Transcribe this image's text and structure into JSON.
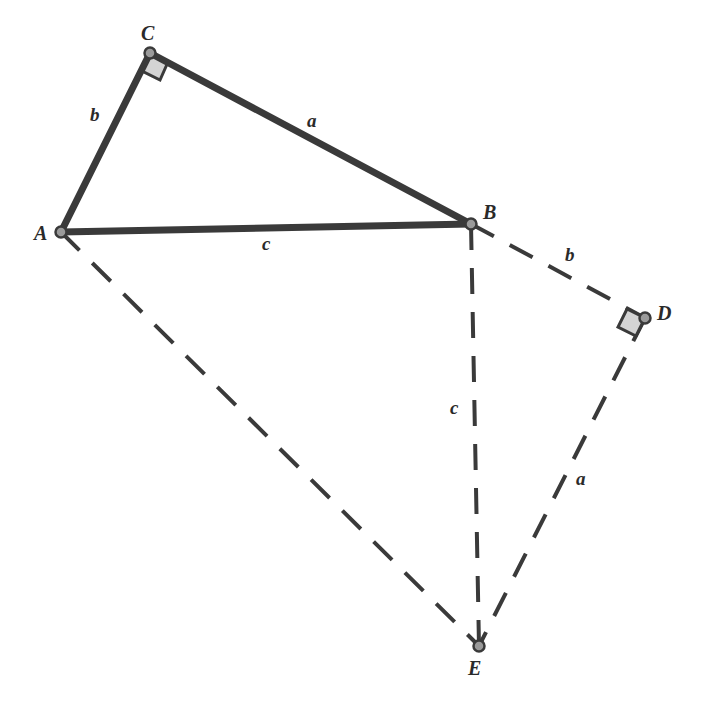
{
  "diagram": {
    "colors": {
      "solid_stroke": "#3a3a3a",
      "dashed_stroke": "#3a3a3a",
      "point_fill": "#9a9a9a",
      "right_angle_fill": "#d4d4d4",
      "label": "#2a2a2a"
    },
    "points": [
      {
        "id": "A",
        "label": "A",
        "x": 61,
        "y": 232
      },
      {
        "id": "B",
        "label": "B",
        "x": 471,
        "y": 224
      },
      {
        "id": "C",
        "label": "C",
        "x": 150,
        "y": 53
      },
      {
        "id": "D",
        "label": "D",
        "x": 645,
        "y": 318
      },
      {
        "id": "E",
        "label": "E",
        "x": 479,
        "y": 646
      }
    ],
    "segments": [
      {
        "from": "A",
        "to": "C",
        "style": "solid",
        "label": "b"
      },
      {
        "from": "C",
        "to": "B",
        "style": "solid",
        "label": "a"
      },
      {
        "from": "A",
        "to": "B",
        "style": "solid",
        "label": "c"
      },
      {
        "from": "B",
        "to": "D",
        "style": "dashed",
        "label": "b"
      },
      {
        "from": "D",
        "to": "E",
        "style": "dashed",
        "label": "a"
      },
      {
        "from": "B",
        "to": "E",
        "style": "dashed",
        "label": "c"
      },
      {
        "from": "A",
        "to": "E",
        "style": "dashed",
        "label": ""
      }
    ],
    "vertex_labels": {
      "A": "A",
      "B": "B",
      "C": "C",
      "D": "D",
      "E": "E"
    },
    "side_labels": {
      "AC": "b",
      "CB": "a",
      "AB": "c",
      "BD": "b",
      "BE": "c",
      "DE": "a"
    },
    "right_angles": [
      "C",
      "D"
    ]
  }
}
